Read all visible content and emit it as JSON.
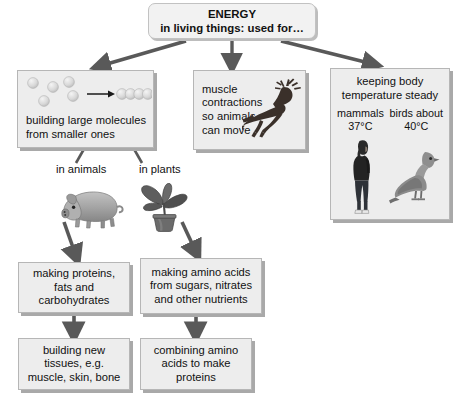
{
  "title": {
    "line1": "ENERGY",
    "line2": "in living things: used for…"
  },
  "boxes": {
    "molecules": {
      "text": "building large molecules\nfrom smaller ones",
      "illustration": "molecule-chain-icon",
      "scattered_spheres": 5,
      "chain_spheres": 5
    },
    "muscle": {
      "text": "muscle\ncontractions\nso animals\ncan move",
      "illustration": "leaping-deer-icon"
    },
    "temperature": {
      "heading": "keeping body\ntemperature steady",
      "mammals_label": "mammals",
      "mammals_value": "37°C",
      "birds_label": "birds about",
      "birds_value": "40°C",
      "mammal_illustration": "human-figure-icon",
      "bird_illustration": "pigeon-icon"
    },
    "proteins": {
      "text": "making proteins,\nfats and\ncarbohydrates"
    },
    "amino": {
      "text": "making amino acids\nfrom sugars, nitrates\nand other nutrients"
    },
    "tissues": {
      "text": "building new\ntissues, e.g.\nmuscle, skin, bone"
    },
    "combining": {
      "text": "combining amino\nacids to make\nproteins"
    }
  },
  "branch_labels": {
    "animals": "in animals",
    "plants": "in plants"
  },
  "illustrations": {
    "pig": "pig-icon",
    "plant": "potted-plant-icon"
  },
  "colors": {
    "background": "#ffffff",
    "box_fill": "#ededed",
    "box_border": "#b6b6b6",
    "box_shadow": "#a9a9a9",
    "arrow": "#595959",
    "title_fill": "#f2f2f2",
    "text": "#111111",
    "sphere": "#d6d6d6",
    "deer": "#3a302a",
    "pig": "#9a9a9a",
    "plant": "#5a5a5a",
    "pigeon": "#8e8e8e",
    "human": "#2a2a2a"
  }
}
